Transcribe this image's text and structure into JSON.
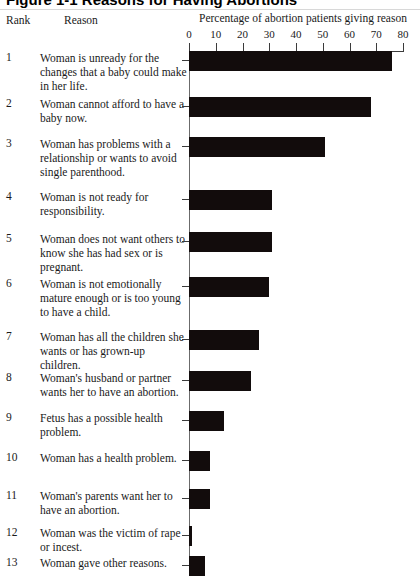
{
  "figure": {
    "title": "Figure 1-1   Reasons for Having Abortions",
    "headers": {
      "rank": "Rank",
      "reason": "Reason",
      "percentage": "Percentage of abortion patients giving reason"
    }
  },
  "chart_data": {
    "type": "bar",
    "orientation": "horizontal",
    "title": "Reasons for Having Abortions",
    "xlabel": "Percentage of abortion patients giving reason",
    "ylabel": "Reason",
    "xlim": [
      0,
      80
    ],
    "ticks": [
      0,
      10,
      20,
      30,
      40,
      50,
      60,
      70,
      80
    ],
    "tick_labels": [
      "0",
      "10",
      "20",
      "30",
      "40",
      "50",
      "60",
      "70",
      "80"
    ],
    "grid": false,
    "legend": false,
    "ranks": [
      1,
      2,
      3,
      4,
      5,
      6,
      7,
      8,
      9,
      10,
      11,
      12,
      13
    ],
    "categories": [
      "Woman is unready for the changes that a baby could make in her life.",
      "Woman cannot afford to have a baby now.",
      "Woman has problems with a relationship or wants to avoid single parenthood.",
      "Woman is not ready for responsibility.",
      "Woman does not want others to know she has had sex or is pregnant.",
      "Woman is not emotionally mature enough or is too young to have a child.",
      "Woman has all the children she wants or has grown-up children.",
      "Woman's husband or partner wants her to have an abortion.",
      "Fetus has a possible health problem.",
      "Woman has a health problem.",
      "Woman's parents want her to have an abortion.",
      "Woman was the victim of rape or incest.",
      "Woman gave other reasons."
    ],
    "values": [
      76,
      68,
      51,
      31,
      31,
      30,
      26,
      23,
      13,
      8,
      8,
      1,
      6
    ],
    "bar_color": "#120c0c",
    "axis_color": "#3b3b3b"
  }
}
